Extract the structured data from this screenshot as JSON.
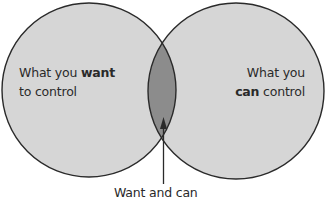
{
  "diagram": {
    "type": "venn",
    "colors": {
      "background": "#ffffff",
      "circle_fill": "#d6d6d6",
      "overlap_fill": "#8c8c8c",
      "stroke": "#2a2a2a",
      "text": "#2a2a2a"
    },
    "sets": [
      {
        "id": "want",
        "line1_prefix": "What you ",
        "line1_bold": "want",
        "line2": "to control"
      },
      {
        "id": "can",
        "line1": "What you",
        "line2_bold": "can",
        "line2_suffix": " control"
      }
    ],
    "overlap": {
      "label": "Want and can",
      "pointer": "arrow-up"
    }
  }
}
